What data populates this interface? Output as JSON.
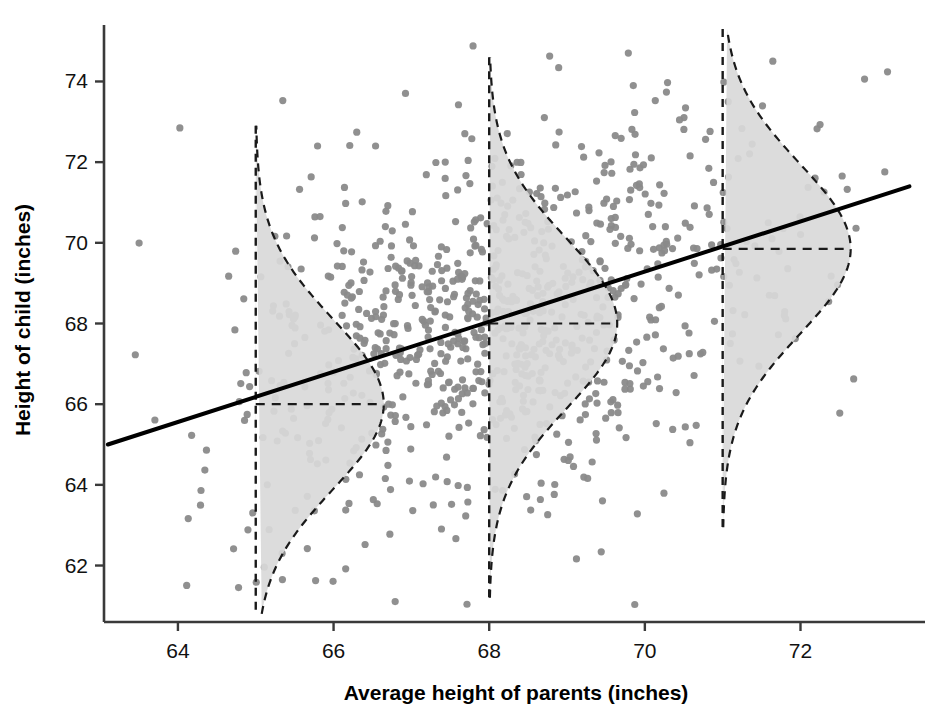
{
  "chart_data": {
    "type": "scatter",
    "title": "",
    "xlabel": "Average height of parents (inches)",
    "ylabel": "Height of child (inches)",
    "xlim": [
      63.05,
      73.6
    ],
    "ylim": [
      60.6,
      75.4
    ],
    "xticks": [
      64,
      66,
      68,
      70,
      72
    ],
    "xtick_labels": [
      "64",
      "66",
      "68",
      "70",
      "72"
    ],
    "yticks": [
      62,
      64,
      66,
      68,
      70,
      72,
      74
    ],
    "ytick_labels": [
      "62",
      "64",
      "66",
      "68",
      "70",
      "72",
      "74"
    ],
    "grid": false,
    "legend": null,
    "point_color": "#8a8a8a",
    "curve_fill": "#d9d9d9",
    "curve_stroke": "#1a1a1a",
    "line_color": "#000000",
    "n_points": 928,
    "regression_line": {
      "label": "regression line of child height on parent height",
      "x_start": 63.1,
      "y_start": 65.0,
      "x_end": 73.4,
      "y_end": 71.4,
      "slope": 0.62,
      "intercept": 25.87
    },
    "conditional_distributions": [
      {
        "x": 65,
        "mean": 66.0,
        "sd": 2.1,
        "top": 72.9,
        "bottom": 60.8,
        "label": "conditional distribution of child height at parent height 65 inches"
      },
      {
        "x": 68,
        "mean": 68.0,
        "sd": 2.1,
        "top": 74.6,
        "bottom": 61.2,
        "label": "conditional distribution of child height at parent height 68 inches"
      },
      {
        "x": 71,
        "mean": 69.85,
        "sd": 2.1,
        "top": 75.3,
        "bottom": 62.95,
        "label": "conditional distribution of child height at parent height 71 inches"
      }
    ],
    "points_note": "scatter of ~928 parent-child height pairs, regression toward the mean"
  }
}
